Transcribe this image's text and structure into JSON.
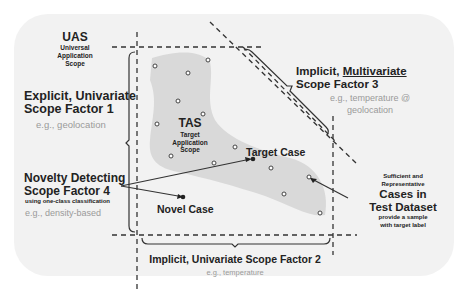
{
  "uas": {
    "title": "UAS",
    "line1": "Universal",
    "line2": "Application",
    "line3": "Scope"
  },
  "factor1": {
    "line1": "Explicit, Univariate",
    "line2": "Scope Factor 1",
    "example": "e.g., geolocation"
  },
  "factor3": {
    "prefix": "Implicit, ",
    "underlined": "Multivariate",
    "line2": "Scope Factor 3",
    "example1": "e.g., temperature @",
    "example2": "geolocation"
  },
  "tas": {
    "title": "TAS",
    "line1": "Target",
    "line2": "Application",
    "line3": "Scope"
  },
  "target_case": {
    "label": "Target Case"
  },
  "novel_case": {
    "label": "Novel Case"
  },
  "factor4": {
    "line1": "Novelty Detecting",
    "line2": "Scope Factor 4",
    "note": "using one-class classification",
    "example": "e.g., density-based"
  },
  "test_dataset": {
    "pre1": "Sufficient and",
    "pre2": "Representative",
    "title1": "Cases in",
    "title2": "Test Dataset",
    "post1": "provide a sample",
    "post2": "with target label"
  },
  "factor2": {
    "label": "Implicit, Univariate Scope Factor 2",
    "example": "e.g., temperature"
  },
  "colors": {
    "background": "#f2f2f2",
    "tas_region": "#d9d9d9",
    "line": "#333333",
    "example_text": "#9a9a9a"
  }
}
